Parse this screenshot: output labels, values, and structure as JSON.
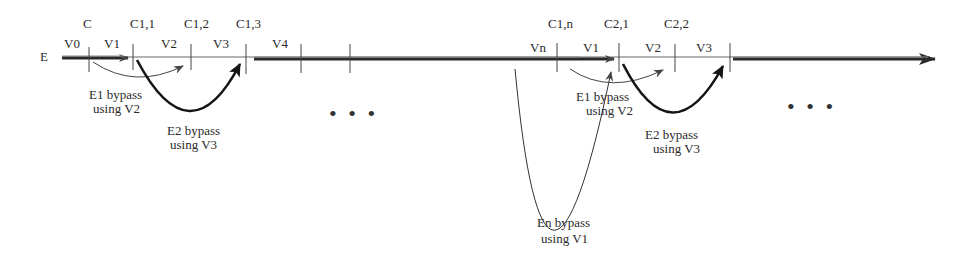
{
  "diagram": {
    "axis_label": "E",
    "colors": {
      "ink": "#2a2a2a",
      "line_thin": "#555555",
      "bypass_light": "#444444",
      "bypass_heavy": "#151515"
    },
    "group1": {
      "top_labels": [
        "C",
        "C1,1",
        "C1,2",
        "C1,3"
      ],
      "segments": [
        "V0",
        "V1",
        "V2",
        "V3",
        "V4"
      ],
      "bypass_e1": {
        "line1": "E1 bypass",
        "line2": "using V2"
      },
      "bypass_e2": {
        "line1": "E2 bypass",
        "line2": "using V3"
      }
    },
    "group2": {
      "top_labels": [
        "C1,n",
        "C2,1",
        "C2,2"
      ],
      "segments": [
        "Vn",
        "V1",
        "V2",
        "V3"
      ],
      "bypass_e1": {
        "line1": "E1 bypass",
        "line2": "using V2"
      },
      "bypass_e2": {
        "line1": "E2 bypass",
        "line2": "using V3"
      },
      "bypass_en": {
        "line1": "En bypass",
        "line2": "using V1"
      }
    },
    "ellipsis": [
      "• • •",
      "• • •"
    ]
  }
}
